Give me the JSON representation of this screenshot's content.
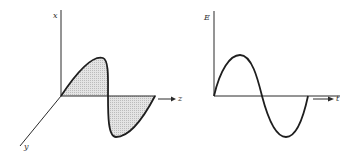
{
  "left_diagram": {
    "description": "Electric field wave in 3D coordinates (shaded sine wave along z-axis)",
    "axis_labels": {
      "vertical": "x",
      "horizontal": "z",
      "diagonal": "y"
    },
    "fill_color": "#d8d8d8",
    "line_color": "#1e1e1e"
  },
  "right_diagram": {
    "description": "Electric field E as a function of time t (one sine period)",
    "axis_labels": {
      "vertical": "E",
      "horizontal": "t"
    },
    "line_color": "#1e1e1e"
  }
}
